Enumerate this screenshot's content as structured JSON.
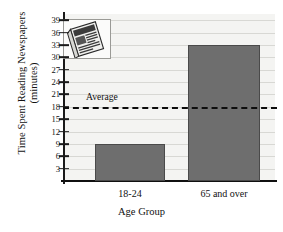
{
  "chart_data": {
    "type": "bar",
    "title": "",
    "xlabel": "Age Group",
    "ylabel": "Time Spent Reading Newspapers (minutes)",
    "ylabel_line1": "Time Spent Reading Newspapers",
    "ylabel_line2": "(minutes)",
    "categories": [
      "18-24",
      "65 and over"
    ],
    "values": [
      9,
      33
    ],
    "ylim": [
      0,
      40.5
    ],
    "yticks": [
      3,
      6,
      9,
      12,
      15,
      18,
      21,
      24,
      27,
      30,
      33,
      36,
      39
    ],
    "ytick_labels": [
      "3",
      "6",
      "9",
      "12",
      "15",
      "18",
      "21",
      "24",
      "27",
      "30",
      "33",
      "36",
      "39"
    ],
    "grid": true,
    "legend": "none",
    "annotations": [
      {
        "name": "average-line",
        "label": "Average",
        "value": 18,
        "style": "dashed-horizontal-line"
      }
    ],
    "series": [
      {
        "name": "Time Spent Reading Newspapers",
        "values": [
          9,
          33
        ],
        "color": "#6e6e6e"
      }
    ],
    "colors": {
      "bar_fill": "#6e6e6e",
      "bar_edge": "#4a4a4a",
      "plot_background": "#f4f4f2",
      "gridline": "#d8d8d4",
      "axis": "#101010",
      "text": "#111111",
      "average_line": "#0d0d0d"
    }
  },
  "decorations": {
    "newspaper_image": {
      "icon": "newspaper-icon",
      "alt": "newspaper clipart"
    }
  }
}
